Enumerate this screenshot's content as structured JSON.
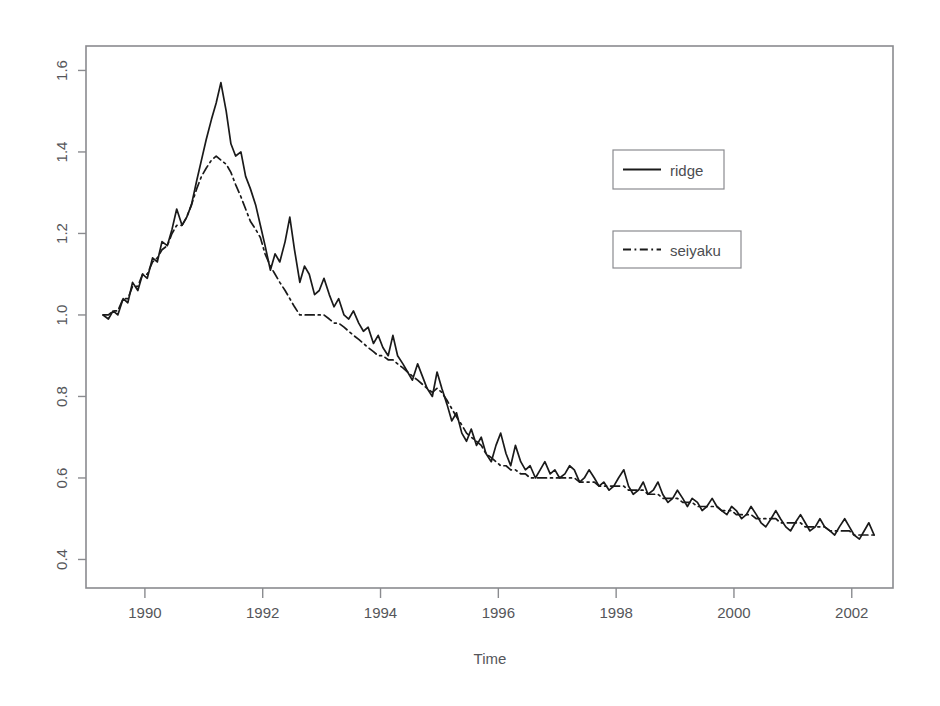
{
  "figure": {
    "background_color": "#ffffff",
    "axis_color": "#8a8b8f",
    "text_color": "#55565a",
    "series_color": "#1a1a1a"
  },
  "axes": {
    "x_title": "Time",
    "y_title": "",
    "x_tick_labels": [
      "1990",
      "1992",
      "1994",
      "1996",
      "1998",
      "2000",
      "2002"
    ],
    "y_tick_labels": [
      "0.4",
      "0.6",
      "0.8",
      "1.0",
      "1.2",
      "1.4",
      "1.6"
    ]
  },
  "legend": {
    "entries": [
      {
        "label": "ridge",
        "style": "solid"
      },
      {
        "label": "seiyaku",
        "style": "dashdot"
      }
    ]
  },
  "chart_data": {
    "type": "line",
    "title": "",
    "xlabel": "Time",
    "ylabel": "",
    "xlim": [
      1989.0,
      2002.7
    ],
    "ylim": [
      0.33,
      1.66
    ],
    "grid": false,
    "legend_position": "upper-right",
    "x_ticks": [
      1990,
      1992,
      1994,
      1996,
      1998,
      2000,
      2002
    ],
    "y_ticks": [
      0.4,
      0.6,
      0.8,
      1.0,
      1.2,
      1.4,
      1.6
    ],
    "x": [
      1989.29,
      1989.38,
      1989.46,
      1989.54,
      1989.63,
      1989.71,
      1989.79,
      1989.88,
      1989.96,
      1990.04,
      1990.13,
      1990.21,
      1990.29,
      1990.38,
      1990.46,
      1990.54,
      1990.63,
      1990.71,
      1990.79,
      1990.88,
      1990.96,
      1991.04,
      1991.13,
      1991.21,
      1991.29,
      1991.38,
      1991.46,
      1991.54,
      1991.63,
      1991.71,
      1991.79,
      1991.88,
      1991.96,
      1992.04,
      1992.13,
      1992.21,
      1992.29,
      1992.38,
      1992.46,
      1992.54,
      1992.63,
      1992.71,
      1992.79,
      1992.88,
      1992.96,
      1993.04,
      1993.13,
      1993.21,
      1993.29,
      1993.38,
      1993.46,
      1993.54,
      1993.63,
      1993.71,
      1993.79,
      1993.88,
      1993.96,
      1994.04,
      1994.13,
      1994.21,
      1994.29,
      1994.38,
      1994.46,
      1994.54,
      1994.63,
      1994.71,
      1994.79,
      1994.88,
      1994.96,
      1995.04,
      1995.13,
      1995.21,
      1995.29,
      1995.38,
      1995.46,
      1995.54,
      1995.63,
      1995.71,
      1995.79,
      1995.88,
      1995.96,
      1996.04,
      1996.13,
      1996.21,
      1996.29,
      1996.38,
      1996.46,
      1996.54,
      1996.63,
      1996.71,
      1996.79,
      1996.88,
      1996.96,
      1997.04,
      1997.13,
      1997.21,
      1997.29,
      1997.38,
      1997.46,
      1997.54,
      1997.63,
      1997.71,
      1997.79,
      1997.88,
      1997.96,
      1998.04,
      1998.13,
      1998.21,
      1998.29,
      1998.38,
      1998.46,
      1998.54,
      1998.63,
      1998.71,
      1998.79,
      1998.88,
      1998.96,
      1999.04,
      1999.13,
      1999.21,
      1999.29,
      1999.38,
      1999.46,
      1999.54,
      1999.63,
      1999.71,
      1999.79,
      1999.88,
      1999.96,
      2000.04,
      2000.13,
      2000.21,
      2000.29,
      2000.38,
      2000.46,
      2000.54,
      2000.63,
      2000.71,
      2000.79,
      2000.88,
      2000.96,
      2001.04,
      2001.13,
      2001.21,
      2001.29,
      2001.38,
      2001.46,
      2001.54,
      2001.63,
      2001.71,
      2001.79,
      2001.88,
      2001.96,
      2002.04,
      2002.13,
      2002.21,
      2002.29,
      2002.38
    ],
    "series": [
      {
        "name": "ridge",
        "style": "solid",
        "values": [
          1.0,
          0.99,
          1.01,
          1.0,
          1.04,
          1.03,
          1.08,
          1.06,
          1.1,
          1.09,
          1.14,
          1.13,
          1.18,
          1.17,
          1.21,
          1.26,
          1.22,
          1.24,
          1.27,
          1.33,
          1.38,
          1.43,
          1.48,
          1.52,
          1.57,
          1.5,
          1.42,
          1.39,
          1.4,
          1.34,
          1.31,
          1.27,
          1.22,
          1.17,
          1.11,
          1.15,
          1.13,
          1.18,
          1.24,
          1.16,
          1.08,
          1.12,
          1.1,
          1.05,
          1.06,
          1.09,
          1.05,
          1.02,
          1.04,
          1.0,
          0.99,
          1.01,
          0.98,
          0.96,
          0.97,
          0.93,
          0.95,
          0.92,
          0.9,
          0.95,
          0.9,
          0.88,
          0.86,
          0.84,
          0.88,
          0.85,
          0.82,
          0.8,
          0.86,
          0.82,
          0.78,
          0.74,
          0.76,
          0.71,
          0.69,
          0.72,
          0.68,
          0.7,
          0.66,
          0.64,
          0.68,
          0.71,
          0.66,
          0.63,
          0.68,
          0.64,
          0.62,
          0.63,
          0.6,
          0.62,
          0.64,
          0.61,
          0.62,
          0.6,
          0.61,
          0.63,
          0.62,
          0.59,
          0.6,
          0.62,
          0.6,
          0.58,
          0.59,
          0.57,
          0.58,
          0.6,
          0.62,
          0.58,
          0.56,
          0.57,
          0.59,
          0.56,
          0.57,
          0.59,
          0.56,
          0.54,
          0.55,
          0.57,
          0.55,
          0.53,
          0.55,
          0.54,
          0.52,
          0.53,
          0.55,
          0.53,
          0.52,
          0.51,
          0.53,
          0.52,
          0.5,
          0.51,
          0.53,
          0.51,
          0.49,
          0.48,
          0.5,
          0.52,
          0.5,
          0.48,
          0.47,
          0.49,
          0.51,
          0.49,
          0.47,
          0.48,
          0.5,
          0.48,
          0.47,
          0.46,
          0.48,
          0.5,
          0.48,
          0.46,
          0.45,
          0.47,
          0.49,
          0.46
        ]
      },
      {
        "name": "seiyaku",
        "style": "dashdot",
        "values": [
          1.0,
          1.0,
          1.01,
          1.01,
          1.04,
          1.04,
          1.07,
          1.07,
          1.1,
          1.1,
          1.13,
          1.14,
          1.16,
          1.17,
          1.2,
          1.22,
          1.22,
          1.24,
          1.27,
          1.31,
          1.34,
          1.36,
          1.38,
          1.39,
          1.38,
          1.37,
          1.35,
          1.32,
          1.29,
          1.26,
          1.23,
          1.21,
          1.19,
          1.15,
          1.12,
          1.1,
          1.08,
          1.06,
          1.04,
          1.02,
          1.0,
          1.0,
          1.0,
          1.0,
          1.0,
          1.0,
          0.99,
          0.98,
          0.98,
          0.97,
          0.96,
          0.95,
          0.94,
          0.93,
          0.92,
          0.91,
          0.9,
          0.9,
          0.89,
          0.89,
          0.88,
          0.87,
          0.86,
          0.85,
          0.84,
          0.83,
          0.82,
          0.81,
          0.82,
          0.81,
          0.79,
          0.77,
          0.75,
          0.73,
          0.71,
          0.7,
          0.69,
          0.68,
          0.66,
          0.65,
          0.64,
          0.63,
          0.63,
          0.62,
          0.62,
          0.61,
          0.61,
          0.6,
          0.6,
          0.6,
          0.6,
          0.6,
          0.6,
          0.6,
          0.6,
          0.6,
          0.6,
          0.59,
          0.59,
          0.59,
          0.59,
          0.58,
          0.58,
          0.58,
          0.58,
          0.58,
          0.58,
          0.57,
          0.57,
          0.57,
          0.57,
          0.56,
          0.56,
          0.56,
          0.55,
          0.55,
          0.55,
          0.55,
          0.54,
          0.54,
          0.54,
          0.53,
          0.53,
          0.53,
          0.53,
          0.53,
          0.52,
          0.52,
          0.52,
          0.51,
          0.51,
          0.51,
          0.51,
          0.5,
          0.5,
          0.5,
          0.5,
          0.5,
          0.49,
          0.49,
          0.49,
          0.49,
          0.49,
          0.48,
          0.48,
          0.48,
          0.48,
          0.48,
          0.47,
          0.47,
          0.47,
          0.47,
          0.47,
          0.46,
          0.46,
          0.46,
          0.46,
          0.46
        ]
      }
    ]
  }
}
